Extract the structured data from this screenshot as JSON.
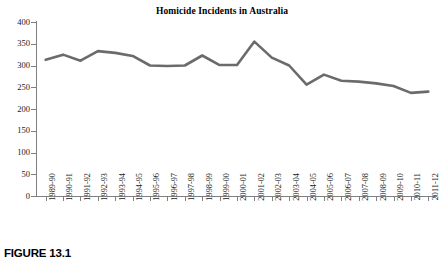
{
  "figure": {
    "caption": "FIGURE 13.1",
    "title": "Homicide Incidents in Australia"
  },
  "chart_data": {
    "type": "line",
    "title": "Homicide Incidents in Australia",
    "xlabel": "",
    "ylabel": "",
    "ylim": [
      0,
      400
    ],
    "yticks": [
      0,
      50,
      100,
      150,
      200,
      250,
      300,
      350,
      400
    ],
    "ytick_labels": [
      "0",
      "50",
      "100",
      "150",
      "200",
      "250",
      "300",
      "350",
      "400"
    ],
    "grid": false,
    "legend": false,
    "line_color": "#6b6b6b",
    "line_width": 2.6,
    "categories": [
      "1989-90",
      "1990-91",
      "1991-92",
      "1992-93",
      "1993-94",
      "1994-95",
      "1995-96",
      "1996-97",
      "1997-98",
      "1998-99",
      "1999-00",
      "2000-01",
      "2001-02",
      "2002-03",
      "2003-04",
      "2004-05",
      "2005-06",
      "2006-07",
      "2007-08",
      "2008-09",
      "2009-10",
      "2010-11",
      "2011-12"
    ],
    "values": [
      313,
      325,
      311,
      333,
      329,
      322,
      300,
      299,
      300,
      323,
      301,
      301,
      355,
      318,
      300,
      256,
      279,
      265,
      263,
      259,
      253,
      237,
      240
    ]
  }
}
